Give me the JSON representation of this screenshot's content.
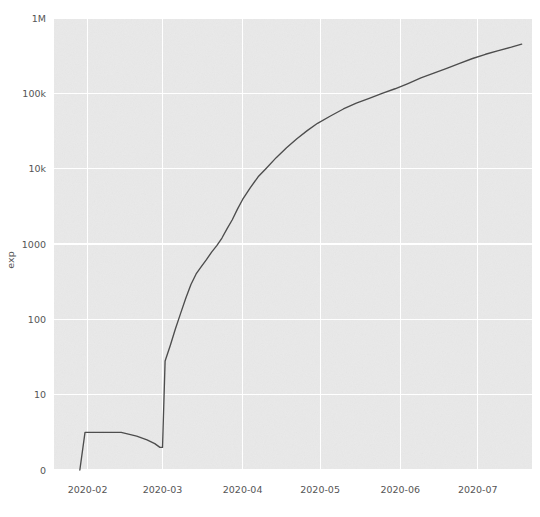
{
  "chart_data": {
    "type": "line",
    "title": "",
    "xlabel": "",
    "ylabel": "exp",
    "yscale": "symlog",
    "grid": true,
    "legend": null,
    "y_ticks": [
      {
        "label": "0",
        "value": 0
      },
      {
        "label": "10",
        "value": 10
      },
      {
        "label": "100",
        "value": 100
      },
      {
        "label": "1000",
        "value": 1000
      },
      {
        "label": "10k",
        "value": 10000
      },
      {
        "label": "100k",
        "value": 100000
      },
      {
        "label": "1M",
        "value": 1000000
      }
    ],
    "x_ticks": [
      {
        "label": "2020-02",
        "value": "2020-02-01"
      },
      {
        "label": "2020-03",
        "value": "2020-03-01"
      },
      {
        "label": "2020-04",
        "value": "2020-04-01"
      },
      {
        "label": "2020-05",
        "value": "2020-05-01"
      },
      {
        "label": "2020-06",
        "value": "2020-06-01"
      },
      {
        "label": "2020-07",
        "value": "2020-07-01"
      }
    ],
    "xlim": [
      "2020-01-19",
      "2020-07-22"
    ],
    "ylim": [
      0,
      1000000
    ],
    "series": [
      {
        "name": "exp",
        "color": "#4d4d4d",
        "x": [
          "2020-01-29",
          "2020-01-31",
          "2020-02-02",
          "2020-02-08",
          "2020-02-14",
          "2020-02-20",
          "2020-02-24",
          "2020-02-27",
          "2020-02-29",
          "2020-03-01",
          "2020-03-02",
          "2020-03-04",
          "2020-03-06",
          "2020-03-08",
          "2020-03-10",
          "2020-03-12",
          "2020-03-14",
          "2020-03-16",
          "2020-03-18",
          "2020-03-20",
          "2020-03-22",
          "2020-03-24",
          "2020-03-26",
          "2020-03-28",
          "2020-03-30",
          "2020-04-01",
          "2020-04-04",
          "2020-04-07",
          "2020-04-10",
          "2020-04-14",
          "2020-04-18",
          "2020-04-22",
          "2020-04-26",
          "2020-04-30",
          "2020-05-05",
          "2020-05-10",
          "2020-05-15",
          "2020-05-20",
          "2020-05-25",
          "2020-05-30",
          "2020-06-04",
          "2020-06-09",
          "2020-06-14",
          "2020-06-19",
          "2020-06-24",
          "2020-06-29",
          "2020-07-04",
          "2020-07-09",
          "2020-07-14",
          "2020-07-18"
        ],
        "y": [
          0,
          5,
          5,
          5,
          5,
          4.5,
          4,
          3.5,
          3,
          3,
          28,
          45,
          75,
          120,
          190,
          290,
          400,
          500,
          620,
          780,
          950,
          1200,
          1600,
          2100,
          2900,
          3900,
          5600,
          7800,
          10000,
          14000,
          19000,
          25000,
          32000,
          40000,
          50000,
          62000,
          74000,
          86000,
          100000,
          115000,
          135000,
          160000,
          185000,
          215000,
          250000,
          290000,
          330000,
          370000,
          410000,
          450000
        ]
      }
    ],
    "axes_geometry": {
      "plot_left": 54,
      "plot_top": 18,
      "plot_right": 532,
      "plot_bottom": 470
    },
    "style": {
      "plot_background": "#e9e9e9",
      "grid_color": "#ffffff",
      "tick_label_color": "#555555",
      "figure_background": "#ffffff",
      "line_color": "#4d4d4d"
    }
  }
}
